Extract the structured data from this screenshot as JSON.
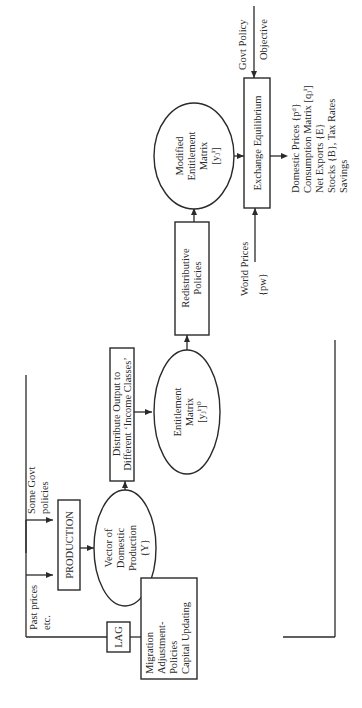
{
  "diagram": {
    "orientation": "rotated-90-ccw",
    "nodes": {
      "past_prices": [
        "Past prices",
        "etc."
      ],
      "some_govt": [
        "Some Govt",
        "policies"
      ],
      "production": "PRODUCTION",
      "vector": [
        "Vector of",
        "Domestic",
        "Production",
        "{Y}"
      ],
      "distribute": [
        "Distribute Output to",
        "Different ‘Income Classes’"
      ],
      "entitlement": [
        "Entitlement",
        "Matrix",
        "[yⱼⁱ]⁰"
      ],
      "redistributive": [
        "Redistributive",
        "Policies"
      ],
      "modified": [
        "Modified",
        "Entitlement",
        "Matrix",
        "[yⱼⁱ]"
      ],
      "world_prices": [
        "World Prices",
        "{pw}"
      ],
      "exchange": "Exchange Equilibrium",
      "govt_policy": [
        "Govt Policy",
        "Objective"
      ],
      "outputs": [
        "Domestic Prices {pᵈ}",
        "Consumption Matrix [qⱼⁱ]",
        "Net Exports {E}",
        "Stocks {B}, Tax Rates",
        "Savings"
      ],
      "lag": "LAG",
      "migration": [
        "Migration",
        "Adjustment-",
        "Policies",
        "Capital Updating"
      ]
    },
    "edges": [
      [
        "past_prices",
        "production"
      ],
      [
        "some_govt",
        "production"
      ],
      [
        "production",
        "vector"
      ],
      [
        "vector",
        "distribute"
      ],
      [
        "distribute",
        "entitlement"
      ],
      [
        "entitlement",
        "redistributive"
      ],
      [
        "redistributive",
        "modified"
      ],
      [
        "modified",
        "exchange"
      ],
      [
        "world_prices",
        "exchange"
      ],
      [
        "govt_policy",
        "exchange"
      ],
      [
        "exchange",
        "outputs"
      ],
      [
        "outputs",
        "migration"
      ],
      [
        "migration",
        "lag"
      ],
      [
        "lag",
        "past_prices"
      ]
    ]
  }
}
